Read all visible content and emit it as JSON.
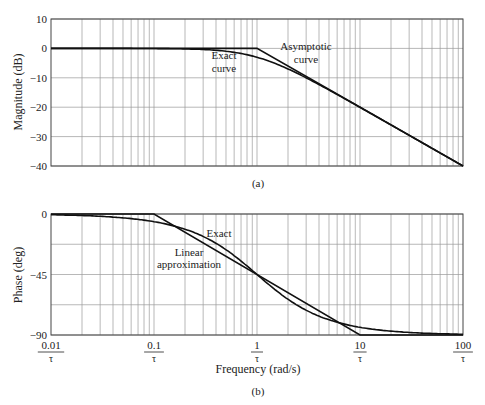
{
  "chart_data": [
    {
      "type": "line",
      "panel": "(a)",
      "title": "",
      "xlabel": "",
      "ylabel": "Magnitude (dB)",
      "xscale": "log",
      "xlim": [
        0.01,
        100
      ],
      "ylim": [
        -40,
        10
      ],
      "yticks": [
        10,
        0,
        -10,
        -20,
        -30,
        -40
      ],
      "grid": true,
      "series": [
        {
          "name": "Asymptotic curve",
          "x": [
            0.01,
            1,
            100
          ],
          "y": [
            0,
            0,
            -40
          ]
        },
        {
          "name": "Exact curve",
          "x": [
            0.01,
            0.1,
            0.2,
            0.5,
            1,
            2,
            5,
            10,
            100
          ],
          "y": [
            0,
            -0.04,
            -0.17,
            -0.97,
            -3.01,
            -6.99,
            -14.15,
            -20.04,
            -40.0
          ]
        }
      ],
      "annotations": [
        {
          "text": "Exact",
          "text2": "curve"
        },
        {
          "text": "Asymptotic",
          "text2": "curve"
        }
      ]
    },
    {
      "type": "line",
      "panel": "(b)",
      "title": "",
      "xlabel": "Frequency (rad/s)",
      "ylabel": "Phase (deg)",
      "xscale": "log",
      "xlim": [
        0.01,
        100
      ],
      "ylim": [
        -90,
        0
      ],
      "yticks": [
        0,
        -45,
        -90
      ],
      "xticks": [
        "0.01/τ",
        "0.1/τ",
        "1/τ",
        "10/τ",
        "100/τ"
      ],
      "grid": true,
      "series": [
        {
          "name": "Linear approximation",
          "x": [
            0.01,
            0.1,
            10,
            100
          ],
          "y": [
            0,
            0,
            -90,
            -90
          ]
        },
        {
          "name": "Exact",
          "x": [
            0.01,
            0.1,
            0.2,
            0.5,
            1,
            2,
            5,
            10,
            100
          ],
          "y": [
            -0.57,
            -5.71,
            -11.31,
            -26.57,
            -45.0,
            -63.43,
            -78.69,
            -84.29,
            -89.43
          ]
        }
      ],
      "annotations": [
        {
          "text": "Exact"
        },
        {
          "text": "Linear",
          "text2": "approximation"
        }
      ]
    }
  ],
  "magnitude_panel": {
    "ylabel": "Magnitude (dB)",
    "yticks": [
      "10",
      "0",
      "−10",
      "−20",
      "−30",
      "−40"
    ],
    "exact_label_1": "Exact",
    "exact_label_2": "curve",
    "asym_label_1": "Asymptotic",
    "asym_label_2": "curve",
    "caption": "(a)"
  },
  "phase_panel": {
    "ylabel": "Phase (deg)",
    "yticks": [
      "0",
      "−45",
      "−90"
    ],
    "exact_label": "Exact",
    "linear_label_1": "Linear",
    "linear_label_2": "approximation",
    "xtick_numerators": [
      "0.01",
      "0.1",
      "1",
      "10",
      "100"
    ],
    "xtick_denominator": "τ",
    "xlabel": "Frequency (rad/s)",
    "caption": "(b)"
  },
  "colors": {
    "curve": "#111111",
    "grid": "#9a9a9a",
    "frame": "#444444",
    "text": "#222222"
  }
}
